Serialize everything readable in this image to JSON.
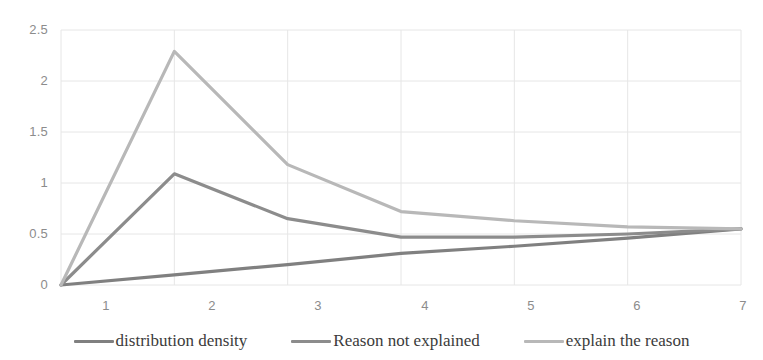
{
  "chart_data": {
    "type": "line",
    "title": "",
    "subtitle": "",
    "xlabel": "",
    "ylabel": "",
    "x": [
      1,
      2,
      3,
      4,
      5,
      6,
      7
    ],
    "xtick_labels": [
      "1",
      "2",
      "3",
      "4",
      "5",
      "6",
      "7"
    ],
    "ytick_labels": [
      "0",
      "0.5",
      "1",
      "1.5",
      "2",
      "2.5"
    ],
    "ylim": [
      0,
      2.5
    ],
    "xlim": [
      1,
      7
    ],
    "grid": true,
    "legend_position": "bottom",
    "series": [
      {
        "name": "distribution density",
        "color": "#808080",
        "values": [
          0.0,
          0.1,
          0.2,
          0.31,
          0.38,
          0.46,
          0.55
        ]
      },
      {
        "name": "Reason not explained",
        "color": "#8c8c8c",
        "values": [
          0.0,
          1.09,
          0.65,
          0.47,
          0.47,
          0.5,
          0.55
        ]
      },
      {
        "name": "explain the reason",
        "color": "#b8b8b8",
        "values": [
          0.0,
          2.29,
          1.18,
          0.72,
          0.63,
          0.57,
          0.55
        ]
      }
    ]
  },
  "axes": {
    "y_ticks": [
      {
        "label": "2.5",
        "value": 2.5
      },
      {
        "label": "2",
        "value": 2
      },
      {
        "label": "1.5",
        "value": 1.5
      },
      {
        "label": "1",
        "value": 1
      },
      {
        "label": "0.5",
        "value": 0.5
      },
      {
        "label": "0",
        "value": 0
      }
    ],
    "x_ticks": [
      {
        "label": "1",
        "value": 1
      },
      {
        "label": "2",
        "value": 2
      },
      {
        "label": "3",
        "value": 3
      },
      {
        "label": "4",
        "value": 4
      },
      {
        "label": "5",
        "value": 5
      },
      {
        "label": "6",
        "value": 6
      },
      {
        "label": "7",
        "value": 7
      }
    ]
  },
  "legend": {
    "items": [
      {
        "label": "distribution density",
        "color": "#808080"
      },
      {
        "label": "Reason not explained",
        "color": "#8c8c8c"
      },
      {
        "label": "explain the reason",
        "color": "#b8b8b8"
      }
    ]
  },
  "style": {
    "grid_color": "#e6e6e6",
    "axis_text_color": "#8c8c8c",
    "legend_text_color": "#3b3b3b",
    "background": "#ffffff"
  }
}
